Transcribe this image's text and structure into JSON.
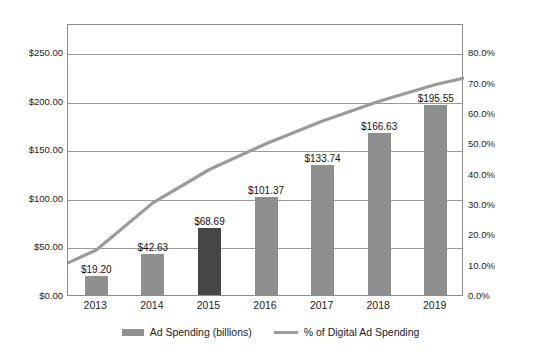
{
  "chart_data": {
    "type": "bar",
    "title": "",
    "subtitle": "",
    "xlabel": "",
    "ylabel": "",
    "categories": [
      "2013",
      "2014",
      "2015",
      "2016",
      "2017",
      "2018",
      "2019"
    ],
    "series": [
      {
        "name": "Ad Spending (billions)",
        "type": "bar",
        "axis": "left",
        "values": [
          19.2,
          42.63,
          68.69,
          101.37,
          133.74,
          166.63,
          195.55
        ],
        "labels": [
          "$19.20",
          "$42.63",
          "$68.69",
          "$101.37",
          "$133.74",
          "$166.63",
          "$195.55"
        ],
        "color": "#8f8f8f",
        "highlight_index": 2,
        "highlight_color": "#454545"
      },
      {
        "name": "% of Digital Ad Spending",
        "type": "line",
        "axis": "right",
        "values": [
          15.5,
          31.0,
          42.0,
          50.5,
          58.0,
          64.5,
          70.0
        ],
        "color": "#9b9b9b"
      }
    ],
    "left_axis": {
      "ticks": [
        "$0.00",
        "$50.00",
        "$100.00",
        "$150.00",
        "$200.00",
        "$250.00"
      ],
      "tick_values": [
        0,
        50,
        100,
        150,
        200,
        250
      ],
      "ylim": [
        0,
        280
      ]
    },
    "right_axis": {
      "ticks": [
        "0.0%",
        "10.0%",
        "20.0%",
        "30.0%",
        "40.0%",
        "50.0%",
        "60.0%",
        "70.0%",
        "80.0%"
      ],
      "tick_values": [
        0,
        10,
        20,
        30,
        40,
        50,
        60,
        70,
        80
      ],
      "ylim": [
        0,
        89.6
      ]
    },
    "grid": true,
    "legend_position": "bottom"
  },
  "legend": {
    "bar_series_label": "Ad Spending (billions)",
    "line_series_label": "% of Digital Ad Spending"
  }
}
